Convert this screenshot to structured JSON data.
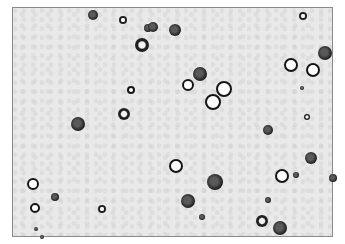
{
  "image": {
    "description": "Grayscale light-microscopy field of round cells on a speckled gray background, enclosed by a thin gray frame",
    "frame": {
      "x": 12,
      "y": 7,
      "width": 321,
      "height": 230,
      "border_color": "#8a8a8a",
      "background": "#e9e9e9"
    },
    "cells": [
      {
        "x": 93,
        "y": 15,
        "r": 5,
        "type": "dark"
      },
      {
        "x": 123,
        "y": 20,
        "r": 4,
        "type": "ringdark"
      },
      {
        "x": 148,
        "y": 28,
        "r": 4,
        "type": "dark"
      },
      {
        "x": 153,
        "y": 27,
        "r": 5,
        "type": "dark"
      },
      {
        "x": 175,
        "y": 30,
        "r": 6,
        "type": "dark"
      },
      {
        "x": 142,
        "y": 45,
        "r": 7,
        "type": "ringdark"
      },
      {
        "x": 131,
        "y": 90,
        "r": 4,
        "type": "ring"
      },
      {
        "x": 124,
        "y": 114,
        "r": 6,
        "type": "ringdark"
      },
      {
        "x": 78,
        "y": 124,
        "r": 7,
        "type": "dark"
      },
      {
        "x": 303,
        "y": 16,
        "r": 4,
        "type": "ringdark"
      },
      {
        "x": 325,
        "y": 53,
        "r": 7,
        "type": "dark"
      },
      {
        "x": 291,
        "y": 65,
        "r": 7,
        "type": "ring"
      },
      {
        "x": 313,
        "y": 70,
        "r": 7,
        "type": "ring"
      },
      {
        "x": 302,
        "y": 88,
        "r": 2,
        "type": "dark"
      },
      {
        "x": 200,
        "y": 74,
        "r": 7,
        "type": "dark"
      },
      {
        "x": 188,
        "y": 85,
        "r": 6,
        "type": "ring"
      },
      {
        "x": 224,
        "y": 89,
        "r": 8,
        "type": "ring"
      },
      {
        "x": 213,
        "y": 102,
        "r": 8,
        "type": "ring"
      },
      {
        "x": 307,
        "y": 117,
        "r": 3,
        "type": "ringdark"
      },
      {
        "x": 268,
        "y": 130,
        "r": 5,
        "type": "dark"
      },
      {
        "x": 311,
        "y": 158,
        "r": 6,
        "type": "dark"
      },
      {
        "x": 176,
        "y": 166,
        "r": 7,
        "type": "ring"
      },
      {
        "x": 215,
        "y": 182,
        "r": 8,
        "type": "dark"
      },
      {
        "x": 282,
        "y": 176,
        "r": 7,
        "type": "ring"
      },
      {
        "x": 296,
        "y": 175,
        "r": 3,
        "type": "dark"
      },
      {
        "x": 333,
        "y": 178,
        "r": 4,
        "type": "dark"
      },
      {
        "x": 188,
        "y": 201,
        "r": 7,
        "type": "dark"
      },
      {
        "x": 268,
        "y": 200,
        "r": 3,
        "type": "dark"
      },
      {
        "x": 202,
        "y": 217,
        "r": 3,
        "type": "dark"
      },
      {
        "x": 262,
        "y": 221,
        "r": 6,
        "type": "ringdark"
      },
      {
        "x": 280,
        "y": 228,
        "r": 7,
        "type": "dark"
      },
      {
        "x": 33,
        "y": 184,
        "r": 6,
        "type": "ring"
      },
      {
        "x": 55,
        "y": 197,
        "r": 4,
        "type": "dark"
      },
      {
        "x": 35,
        "y": 208,
        "r": 5,
        "type": "ring"
      },
      {
        "x": 102,
        "y": 209,
        "r": 4,
        "type": "ringdark"
      },
      {
        "x": 36,
        "y": 229,
        "r": 2,
        "type": "dark"
      },
      {
        "x": 42,
        "y": 237,
        "r": 2,
        "type": "dark"
      }
    ]
  }
}
